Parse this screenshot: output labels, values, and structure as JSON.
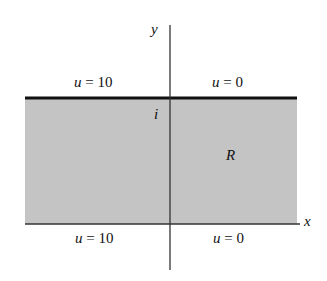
{
  "diagram": {
    "axes": {
      "x_label": "x",
      "y_label": "y"
    },
    "region_label": "R",
    "point_label": "i",
    "top_boundary": {
      "left": "u = 10",
      "right": "u = 0"
    },
    "bottom_boundary": {
      "left": "u = 10",
      "right": "u = 0"
    },
    "colors": {
      "region_fill": "#c4c4c4",
      "boundary": "#111111",
      "axis": "#333333"
    }
  }
}
